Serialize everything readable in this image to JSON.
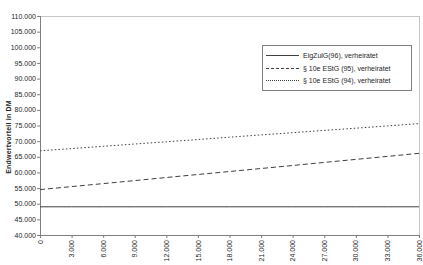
{
  "figure": {
    "background": "#ffffff",
    "border_color": "#c6c6c6",
    "axis_color": "#7f7f7f",
    "line_color": "#3f3f3f",
    "text_color": "#262626"
  },
  "chart_data": {
    "type": "line",
    "title": "",
    "xlabel": "",
    "ylabel": "Endwertvorteil in DM",
    "xlim": [
      0,
      36000
    ],
    "ylim": [
      40000,
      110000
    ],
    "grid": false,
    "legend_position": "upper right",
    "x_tick_labels": [
      "0",
      "3.000",
      "6.000",
      "9.000",
      "12.000",
      "15.000",
      "18.000",
      "21.000",
      "24.000",
      "27.000",
      "30.000",
      "33.000",
      "36.000"
    ],
    "y_tick_labels": [
      "110.000",
      "105.000",
      "100.000",
      "95.000",
      "90.000",
      "85.000",
      "80.000",
      "75.000",
      "70.000",
      "65.000",
      "60.000",
      "55.000",
      "50.000",
      "45.000",
      "40.000"
    ],
    "x": [
      0,
      3000,
      6000,
      9000,
      12000,
      15000,
      18000,
      21000,
      24000,
      27000,
      30000,
      33000,
      36000
    ],
    "series": [
      {
        "name": "EigZulG(96), verheiratet",
        "style": "solid",
        "values": [
          49000,
          49000,
          49000,
          49000,
          49000,
          49000,
          49000,
          49000,
          49000,
          49000,
          49000,
          49000,
          49000
        ]
      },
      {
        "name": "§ 10e EStG (95), verheiratet",
        "style": "dashed",
        "values": [
          54500,
          55470,
          56430,
          57400,
          58370,
          59330,
          60300,
          61270,
          62230,
          63200,
          64170,
          65130,
          66100
        ]
      },
      {
        "name": "§ 10e EStG (94), verheiratet",
        "style": "dotted",
        "values": [
          66900,
          67630,
          68350,
          69080,
          69800,
          70530,
          71250,
          71980,
          72700,
          73430,
          74150,
          74880,
          75600
        ]
      }
    ]
  }
}
